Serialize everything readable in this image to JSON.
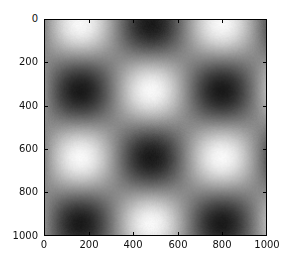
{
  "chart_data": {
    "type": "heatmap",
    "title": "",
    "xlabel": "",
    "ylabel": "",
    "colormap": "gray",
    "colors": {
      "min": "#1a1a1a",
      "mid": "#8a8a8a",
      "max": "#f8f8f8"
    },
    "xlim": [
      0,
      1000
    ],
    "ylim": [
      1000,
      0
    ],
    "y_inverted": true,
    "grid": false,
    "legend": null,
    "xticks": [
      0,
      200,
      400,
      600,
      800,
      1000
    ],
    "yticks": [
      0,
      200,
      400,
      600,
      800,
      1000
    ],
    "xtick_labels": [
      "0",
      "200",
      "400",
      "600",
      "800",
      "1000"
    ],
    "ytick_labels": [
      "0",
      "200",
      "400",
      "600",
      "800",
      "1000"
    ],
    "function": "z = cos(2*pi*(x-160)/640) * cos(2*pi*(y-20)/620)",
    "bright_peaks": [
      [
        160,
        20
      ],
      [
        800,
        20
      ],
      [
        480,
        320
      ],
      [
        160,
        630
      ],
      [
        800,
        630
      ],
      [
        480,
        940
      ]
    ],
    "dark_peaks": [
      [
        480,
        20
      ],
      [
        160,
        320
      ],
      [
        800,
        320
      ],
      [
        480,
        630
      ],
      [
        160,
        940
      ],
      [
        800,
        940
      ]
    ],
    "params": {
      "x_center": 160,
      "y_center": 20,
      "x_period": 640,
      "y_period": 620
    }
  }
}
